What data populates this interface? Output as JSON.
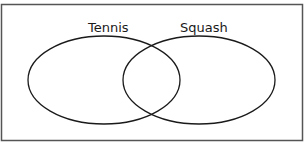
{
  "diagram": {
    "type": "venn",
    "sets": [
      {
        "label": "Tennis"
      },
      {
        "label": "Squash"
      }
    ],
    "colors": {
      "stroke": "#1a1a1a",
      "frame": "#555555",
      "background": "#ffffff"
    }
  }
}
